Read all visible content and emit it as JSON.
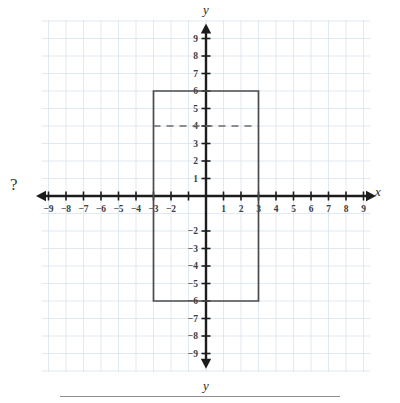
{
  "figure": {
    "marker_left": "?",
    "axis_label_x": "x",
    "axis_label_y_top": "y",
    "axis_label_y_bottom": "y",
    "grid_color": "#d9e3ef",
    "axis_color": "#1c1c1c",
    "shape_color": "#4a4a4a",
    "dash_color": "#6b6b6b",
    "label_color": "#3d3d3d"
  },
  "chart_data": {
    "type": "scatter",
    "title": "",
    "subtitle": "",
    "xlabel": "x",
    "ylabel": "y",
    "xlim": [
      -10,
      10
    ],
    "ylim": [
      -10,
      10
    ],
    "grid": true,
    "legend": "none",
    "x_ticks": [
      -9,
      -8,
      -7,
      -6,
      -5,
      -4,
      -3,
      -2,
      -1,
      1,
      2,
      3,
      4,
      5,
      6,
      7,
      8,
      9
    ],
    "x_tick_labels": [
      "-9",
      "-8",
      "-7",
      "-6",
      "-5",
      "-4",
      "-3",
      "-2",
      "",
      "1",
      "2",
      "3",
      "4",
      "5",
      "6",
      "7",
      "8",
      "9"
    ],
    "y_ticks": [
      9,
      8,
      7,
      6,
      5,
      4,
      3,
      2,
      1,
      -2,
      -3,
      -4,
      -5,
      -6,
      -7,
      -8,
      -9
    ],
    "y_tick_labels": [
      "9",
      "8",
      "7",
      "6",
      "5",
      "4",
      "3",
      "2",
      "1",
      "-2",
      "-3",
      "-4",
      "-5",
      "-6",
      "-7",
      "-8",
      "-9"
    ],
    "shapes": [
      {
        "name": "rectangle",
        "type": "polygon",
        "vertices": [
          [
            -3,
            6
          ],
          [
            3,
            6
          ],
          [
            3,
            -6
          ],
          [
            -3,
            -6
          ]
        ],
        "x_min": -3,
        "x_max": 3,
        "y_min": -6,
        "y_max": 6,
        "width": 6,
        "height": 12,
        "style": "solid"
      },
      {
        "name": "horizontal-dashed-line",
        "type": "segment",
        "from": [
          -3,
          4
        ],
        "to": [
          3,
          4
        ],
        "y": 4,
        "style": "dashed"
      }
    ],
    "annotations": [
      {
        "name": "question-mark",
        "text": "?",
        "position": "left-of-x-axis"
      }
    ]
  }
}
